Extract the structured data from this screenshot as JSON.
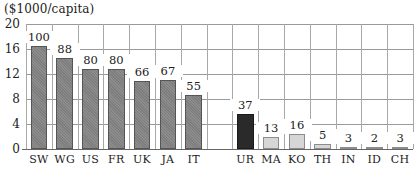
{
  "chart_data": {
    "type": "bar",
    "title": "",
    "ylabel": "($1000/capita)",
    "xlabel": "",
    "ylim": [
      0,
      20
    ],
    "yticks": [
      0,
      4,
      8,
      12,
      16,
      20
    ],
    "grid": true,
    "legend": null,
    "categories": [
      "SW",
      "WG",
      "US",
      "FR",
      "UK",
      "JA",
      "IT",
      "",
      "UR",
      "MA",
      "KO",
      "TH",
      "IN",
      "ID",
      "CH"
    ],
    "values": [
      16.5,
      14.6,
      12.8,
      12.8,
      10.9,
      11.1,
      8.7,
      null,
      5.6,
      1.9,
      2.4,
      0.8,
      0.4,
      0.2,
      0.4
    ],
    "annotations": [
      100,
      88,
      80,
      80,
      66,
      67,
      55,
      null,
      37,
      13,
      16,
      5,
      3,
      2,
      3
    ],
    "groups": [
      {
        "name": "developed",
        "categories": [
          "SW",
          "WG",
          "US",
          "FR",
          "UK",
          "JA",
          "IT"
        ],
        "color": "#7d7d7d"
      },
      {
        "name": "soviet",
        "categories": [
          "UR"
        ],
        "color": "#2a2a2a"
      },
      {
        "name": "developing",
        "categories": [
          "MA",
          "KO",
          "TH",
          "IN",
          "ID",
          "CH"
        ],
        "color": "#d6d6d6"
      }
    ]
  },
  "unit_label": "($1000/capita)",
  "yticks": [
    "0",
    "4",
    "8",
    "12",
    "16",
    "20"
  ],
  "bars": [
    {
      "label": "SW",
      "value": 16.5,
      "annotation": "100",
      "group": "dev"
    },
    {
      "label": "WG",
      "value": 14.6,
      "annotation": "88",
      "group": "dev"
    },
    {
      "label": "US",
      "value": 12.8,
      "annotation": "80",
      "group": "dev"
    },
    {
      "label": "FR",
      "value": 12.8,
      "annotation": "80",
      "group": "dev"
    },
    {
      "label": "UK",
      "value": 10.9,
      "annotation": "66",
      "group": "dev"
    },
    {
      "label": "JA",
      "value": 11.1,
      "annotation": "67",
      "group": "dev"
    },
    {
      "label": "IT",
      "value": 8.7,
      "annotation": "55",
      "group": "dev"
    },
    {
      "label": "",
      "value": null,
      "annotation": "",
      "group": "gap"
    },
    {
      "label": "UR",
      "value": 5.6,
      "annotation": "37",
      "group": "ussr"
    },
    {
      "label": "MA",
      "value": 1.9,
      "annotation": "13",
      "group": "ldc"
    },
    {
      "label": "KO",
      "value": 2.4,
      "annotation": "16",
      "group": "ldc"
    },
    {
      "label": "TH",
      "value": 0.8,
      "annotation": "5",
      "group": "ldc"
    },
    {
      "label": "IN",
      "value": 0.4,
      "annotation": "3",
      "group": "ldc"
    },
    {
      "label": "ID",
      "value": 0.2,
      "annotation": "2",
      "group": "ldc"
    },
    {
      "label": "CH",
      "value": 0.4,
      "annotation": "3",
      "group": "ldc"
    }
  ]
}
